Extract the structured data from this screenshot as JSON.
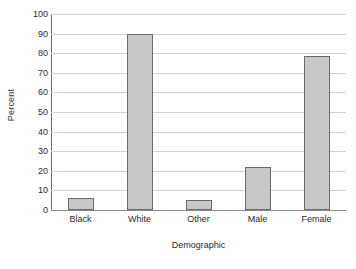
{
  "chart_data": {
    "type": "bar",
    "title": "",
    "xlabel": "Demographic",
    "ylabel": "Percent",
    "categories": [
      "Black",
      "White",
      "Other",
      "Male",
      "Female"
    ],
    "values": [
      6,
      90,
      5,
      22,
      78.5
    ],
    "ylim": [
      0,
      100
    ],
    "yticks": [
      0,
      10,
      20,
      30,
      40,
      50,
      60,
      70,
      80,
      90,
      100
    ],
    "ytick_labels": [
      "0",
      "10",
      "20",
      "30",
      "40",
      "50",
      "60",
      "70",
      "80",
      "90",
      "100"
    ],
    "grid": "horizontal",
    "legend": "none",
    "series": [
      {
        "name": "Percent",
        "values": [
          6,
          90,
          5,
          22,
          78.5
        ]
      }
    ],
    "colors": {
      "bar_fill": "#c8c8c8",
      "bar_border": "#6b6b6b",
      "gridline": "#d2d2d2",
      "axis": "#6e6e6e",
      "text": "#2b2b2b",
      "background": "#ffffff"
    }
  }
}
